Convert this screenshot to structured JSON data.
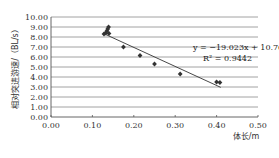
{
  "chart_data": {
    "type": "scatter",
    "title": "",
    "xlabel": "体长/m",
    "ylabel": "相对突进游速/（BL/s）",
    "xlim": [
      0.0,
      0.5
    ],
    "ylim": [
      0.0,
      10.0
    ],
    "x_ticks": [
      "0.00",
      "0.10",
      "0.20",
      "0.30",
      "0.40",
      "0.50"
    ],
    "y_ticks": [
      "0.00",
      "1.00",
      "2.00",
      "3.00",
      "4.00",
      "5.00",
      "6.00",
      "7.00",
      "8.00",
      "9.00",
      "10.00"
    ],
    "grid": "horizontal",
    "series": [
      {
        "name": "measured",
        "marker": "diamond",
        "points": [
          {
            "x": 0.128,
            "y": 8.3
          },
          {
            "x": 0.132,
            "y": 8.4
          },
          {
            "x": 0.135,
            "y": 8.6
          },
          {
            "x": 0.137,
            "y": 8.8
          },
          {
            "x": 0.139,
            "y": 9.0
          },
          {
            "x": 0.14,
            "y": 8.35
          },
          {
            "x": 0.175,
            "y": 7.0
          },
          {
            "x": 0.215,
            "y": 6.15
          },
          {
            "x": 0.25,
            "y": 5.3
          },
          {
            "x": 0.312,
            "y": 4.3
          },
          {
            "x": 0.4,
            "y": 3.5
          },
          {
            "x": 0.408,
            "y": 3.45
          }
        ]
      }
    ],
    "trendline": {
      "type": "linear",
      "slope": -19.023,
      "intercept": 10.762,
      "x_range": [
        0.128,
        0.41
      ]
    },
    "annotations": {
      "equation": "y = −19.023x + 10.762",
      "r_squared": "R² = 0.9442"
    },
    "colors": {
      "marker": "#333333",
      "line": "#333333",
      "grid": "#8a8a8a"
    }
  }
}
